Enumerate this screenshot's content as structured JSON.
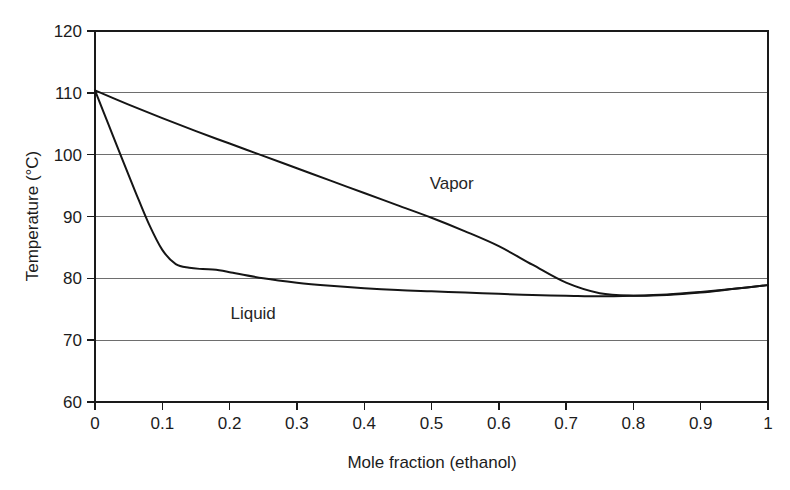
{
  "chart_data": {
    "type": "line",
    "title": "",
    "xlabel": "Mole fraction (ethanol)",
    "ylabel": "Temperature (°C)",
    "xlim": [
      0,
      1
    ],
    "ylim": [
      60,
      120
    ],
    "grid": "horizontal",
    "legend_position": "inline-annotation",
    "x_ticks": [
      "0",
      "0.1",
      "0.2",
      "0.3",
      "0.4",
      "0.5",
      "0.6",
      "0.7",
      "0.8",
      "0.9",
      "1"
    ],
    "x_tick_values": [
      0,
      0.1,
      0.2,
      0.3,
      0.4,
      0.5,
      0.6,
      0.7,
      0.8,
      0.9,
      1
    ],
    "y_ticks": [
      "60",
      "70",
      "80",
      "90",
      "100",
      "110",
      "120"
    ],
    "y_tick_values": [
      60,
      70,
      80,
      90,
      100,
      110,
      120
    ],
    "annotations": [
      {
        "text": "Vapor",
        "x": 0.53,
        "y": 94.5
      },
      {
        "text": "Liquid",
        "x": 0.235,
        "y": 73.5
      }
    ],
    "series": [
      {
        "name": "Vapor",
        "x": [
          0.0,
          0.05,
          0.1,
          0.15,
          0.2,
          0.25,
          0.3,
          0.35,
          0.4,
          0.45,
          0.5,
          0.55,
          0.6,
          0.65,
          0.7,
          0.75,
          0.8,
          0.85,
          0.9,
          0.95,
          1.0
        ],
        "y": [
          110.4,
          108.1,
          105.9,
          103.8,
          101.8,
          99.8,
          97.8,
          95.8,
          93.8,
          91.8,
          89.8,
          87.6,
          85.2,
          82.2,
          79.3,
          77.6,
          77.2,
          77.3,
          77.7,
          78.3,
          78.9
        ]
      },
      {
        "name": "Liquid",
        "x": [
          0.0,
          0.02,
          0.04,
          0.06,
          0.08,
          0.1,
          0.12,
          0.14,
          0.16,
          0.18,
          0.2,
          0.25,
          0.3,
          0.35,
          0.4,
          0.45,
          0.5,
          0.55,
          0.6,
          0.65,
          0.7,
          0.75,
          0.8,
          0.85,
          0.9,
          0.95,
          1.0
        ],
        "y": [
          110.4,
          104.9,
          99.4,
          94.0,
          88.8,
          84.6,
          82.3,
          81.7,
          81.5,
          81.4,
          81.0,
          80.0,
          79.3,
          78.8,
          78.4,
          78.1,
          77.9,
          77.7,
          77.5,
          77.3,
          77.2,
          77.1,
          77.2,
          77.4,
          77.8,
          78.3,
          78.9
        ]
      }
    ],
    "azeotrope": {
      "x": 0.76,
      "y": 77.1,
      "note": "minimum-boiling azeotrope where vapor and liquid curves meet"
    }
  },
  "colors": {
    "background": "#ffffff",
    "curve": "#151515",
    "gridline": "#6e6e6e",
    "frame": "#1a1a1a",
    "text": "#1c1c1c"
  }
}
